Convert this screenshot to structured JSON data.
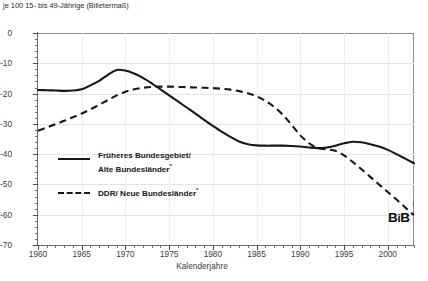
{
  "caption": {
    "line_cut_off": "nettoreproduktionsrate und Geburtenbilanz",
    "line_visible": "je 100 15- bis 49-Jährige (Billetermaß)"
  },
  "axes": {
    "ylabel": "",
    "xlabel": "Kalenderjahre",
    "y_ticks": [
      0,
      -10,
      -20,
      -30,
      -40,
      -50,
      -60,
      -70
    ],
    "y_tick_labels": [
      "0",
      "-10",
      "-20",
      "-30",
      "-40",
      "-50",
      "-60",
      "-70"
    ],
    "y_minor_step": 2,
    "x_ticks": [
      1960,
      1965,
      1970,
      1975,
      1980,
      1985,
      1990,
      1995,
      2000
    ],
    "x_tick_labels": [
      "1960",
      "1965",
      "1970",
      "1975",
      "1980",
      "1985",
      "1990",
      "1995",
      "2000"
    ],
    "x_minor_step": 1
  },
  "legend": {
    "position": "inside-lower-left",
    "entries": [
      {
        "label_line1": "Früheres Bundesgebiet/",
        "label_line2": "Alte Bundesländer",
        "footnote_mark": "*",
        "style": "solid",
        "color": "#17171a"
      },
      {
        "label_line1": "DDR/ Neue Bundesländer",
        "label_line2": "",
        "footnote_mark": "*",
        "style": "dashed",
        "color": "#17171a"
      }
    ]
  },
  "logo": {
    "text_b1": "B",
    "text_i": "i",
    "text_b2": "B"
  },
  "colors": {
    "series_solid": "#17171a",
    "series_dashed": "#17171a",
    "grid": "#e4e4e6",
    "axis": "#6d6d72",
    "text": "#2a2a2e",
    "background": "#ffffff"
  },
  "chart_data": {
    "type": "line",
    "title": "je 100 15- bis 49-Jährige (Billetermaß)",
    "xlabel": "Kalenderjahre",
    "ylabel": "",
    "xlim": [
      1960,
      2003
    ],
    "ylim": [
      -70,
      0
    ],
    "grid": true,
    "legend_position": "inside-lower-left",
    "x": [
      1960,
      1961,
      1962,
      1963,
      1964,
      1965,
      1966,
      1967,
      1968,
      1969,
      1970,
      1971,
      1972,
      1973,
      1974,
      1975,
      1976,
      1977,
      1978,
      1979,
      1980,
      1981,
      1982,
      1983,
      1984,
      1985,
      1986,
      1987,
      1988,
      1989,
      1990,
      1991,
      1992,
      1993,
      1994,
      1995,
      1996,
      1997,
      1998,
      1999,
      2000,
      2001,
      2002,
      2003
    ],
    "series": [
      {
        "name": "Früheres Bundesgebiet/ Alte Bundesländer",
        "style": "solid",
        "values": [
          -18.8,
          -18.9,
          -19.0,
          -19.1,
          -19.0,
          -18.6,
          -17.3,
          -15.8,
          -13.8,
          -12.2,
          -12.4,
          -13.4,
          -14.8,
          -16.6,
          -18.6,
          -20.6,
          -22.6,
          -24.6,
          -26.6,
          -28.7,
          -30.7,
          -32.6,
          -34.3,
          -35.8,
          -36.7,
          -37.1,
          -37.2,
          -37.2,
          -37.2,
          -37.3,
          -37.5,
          -37.8,
          -38.0,
          -37.8,
          -37.2,
          -36.4,
          -35.9,
          -36.1,
          -36.7,
          -37.5,
          -38.6,
          -40.0,
          -41.5,
          -43.0
        ]
      },
      {
        "name": "DDR/ Neue Bundesländer",
        "style": "dashed",
        "values": [
          -32.3,
          -31.2,
          -30.1,
          -29.0,
          -27.8,
          -26.6,
          -25.2,
          -23.7,
          -22.1,
          -20.6,
          -19.4,
          -18.6,
          -18.1,
          -17.8,
          -17.7,
          -17.7,
          -17.8,
          -17.9,
          -18.0,
          -18.1,
          -18.2,
          -18.4,
          -18.7,
          -19.2,
          -19.9,
          -20.9,
          -22.4,
          -24.4,
          -27.0,
          -30.3,
          -33.8,
          -36.4,
          -38.0,
          -38.4,
          -38.9,
          -40.4,
          -42.6,
          -45.0,
          -47.5,
          -50.0,
          -52.5,
          -55.0,
          -57.6,
          -60.2
        ]
      }
    ]
  }
}
